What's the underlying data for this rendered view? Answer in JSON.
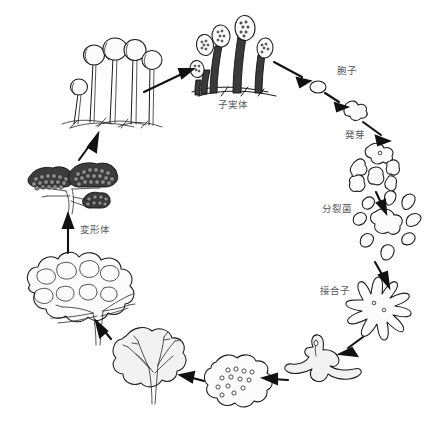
{
  "diagram": {
    "background_color": "#ffffff",
    "ink_color": "#1a1a1a",
    "label_color": "#55585c",
    "labels": [
      {
        "id": "fruiting-body",
        "text": "子実体",
        "x": 233,
        "y": 108
      },
      {
        "id": "spore",
        "text": "胞子",
        "x": 337,
        "y": 74
      },
      {
        "id": "germination",
        "text": "発芽",
        "x": 345,
        "y": 138
      },
      {
        "id": "swarm-cells",
        "text": "分裂菌",
        "x": 352,
        "y": 212
      },
      {
        "id": "zygote",
        "text": "接合子",
        "x": 320,
        "y": 294
      },
      {
        "id": "plasmodium",
        "text": "変形体",
        "x": 80,
        "y": 233
      }
    ],
    "stages": [
      {
        "id": "sporangia-mature",
        "label": "子実体",
        "position": "top-center"
      },
      {
        "id": "spore",
        "label": "胞子",
        "position": "upper-right"
      },
      {
        "id": "germinating-spore",
        "label": "発芽",
        "position": "right-upper"
      },
      {
        "id": "myxamoebae",
        "label": "",
        "position": "right"
      },
      {
        "id": "swarm-cells",
        "label": "分裂菌",
        "position": "right-middle"
      },
      {
        "id": "zygote",
        "label": "接合子",
        "position": "right-lower"
      },
      {
        "id": "young-amoeba",
        "label": "",
        "position": "bottom-right"
      },
      {
        "id": "multinucleate-plasmodium",
        "label": "",
        "position": "bottom-center"
      },
      {
        "id": "fan-plasmodium",
        "label": "",
        "position": "bottom-left"
      },
      {
        "id": "mature-plasmodium",
        "label": "変形体",
        "position": "left"
      },
      {
        "id": "sporangia-forming",
        "label": "",
        "position": "left-upper"
      },
      {
        "id": "sporangia-stalked",
        "label": "",
        "position": "top-left"
      }
    ],
    "arrow_count": 11,
    "flow_direction": "clockwise"
  }
}
